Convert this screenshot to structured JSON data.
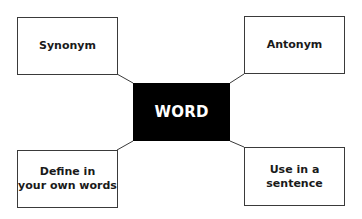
{
  "diagram": {
    "center": {
      "label": "WORD",
      "fill": "#000000",
      "text_color": "#ffffff"
    },
    "nodes": [
      {
        "id": "top-left",
        "label": "Synonym"
      },
      {
        "id": "top-right",
        "label": "Antonym"
      },
      {
        "id": "bottom-left",
        "label": "Define in your own words",
        "lines": [
          "Define in",
          "your own words"
        ]
      },
      {
        "id": "bottom-right",
        "label": "Use in a sentence",
        "lines": [
          "Use in a",
          "sentence"
        ]
      }
    ]
  }
}
